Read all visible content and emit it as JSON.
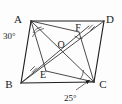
{
  "figure": {
    "kind": "geometry-diagram",
    "background_color": "#fdfdfd",
    "stroke_color": "#1f1f1f",
    "label_color": "#1a1a1a"
  },
  "vertices": [
    {
      "id": "A",
      "label": "A",
      "x": 31,
      "y": 21,
      "label_x": 19,
      "label_y": 19
    },
    {
      "id": "D",
      "label": "D",
      "x": 104,
      "y": 21,
      "label_x": 107,
      "label_y": 19
    },
    {
      "id": "B",
      "label": "B",
      "x": 21,
      "y": 83,
      "label_x": 9,
      "label_y": 85
    },
    {
      "id": "C",
      "label": "C",
      "x": 94,
      "y": 82,
      "label_x": 99,
      "label_y": 85
    }
  ],
  "interior_points": [
    {
      "id": "O",
      "label": "O",
      "x": 63,
      "y": 51,
      "label_x": 59,
      "label_y": 46
    },
    {
      "id": "E",
      "label": "E",
      "x": 46,
      "y": 71,
      "label_x": 41,
      "label_y": 77
    },
    {
      "id": "F",
      "label": "F",
      "x": 79,
      "y": 32,
      "label_x": 75,
      "label_y": 30
    }
  ],
  "sides": [
    {
      "name": "AD",
      "from": "A",
      "to": "D"
    },
    {
      "name": "DC",
      "from": "D",
      "to": "C"
    },
    {
      "name": "CB",
      "from": "C",
      "to": "B"
    },
    {
      "name": "BA",
      "from": "B",
      "to": "A"
    }
  ],
  "diagonals": [
    {
      "name": "AC",
      "from": "A",
      "to": "C"
    },
    {
      "name": "BD",
      "from": "B",
      "to": "D"
    }
  ],
  "cevians": [
    {
      "name": "AE",
      "from": "A",
      "to": "E",
      "note": "A to E on BC side region"
    },
    {
      "name": "EC",
      "from": "E",
      "to": "C",
      "note": "E to C"
    },
    {
      "name": "CF",
      "from": "C",
      "to": "F",
      "note": "C to F on AD side region"
    },
    {
      "name": "FA",
      "from": "F",
      "to": "A",
      "note": "F to A"
    },
    {
      "name": "BF",
      "from": "B",
      "to": "F",
      "note": "B through O to F"
    }
  ],
  "angles": [
    {
      "id": "angle-at-A",
      "label": "30°",
      "value": 30,
      "unit": "degrees",
      "vertex": "A",
      "label_x": 3,
      "label_y": 38
    },
    {
      "id": "angle-at-C",
      "label": "25°",
      "value": 25,
      "unit": "degrees",
      "vertex": "C",
      "label_x": 64,
      "label_y": 100
    }
  ],
  "tick_marks": [
    {
      "id": "tick-on-BE",
      "note": "congruence tick on segment near B-E"
    },
    {
      "id": "tick-on-FD",
      "note": "congruence tick on segment near F-D"
    }
  ]
}
